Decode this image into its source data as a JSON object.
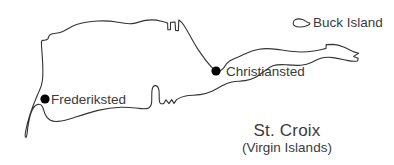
{
  "map": {
    "title": "St. Croix",
    "subtitle": "(Virgin Islands)",
    "background_color": "#ffffff",
    "outline_color": "#333333",
    "marker_color": "#000000",
    "text_color": "#3a3a3a",
    "cities": [
      {
        "name": "Frederiksted",
        "marker": "filled-circle",
        "x": 45,
        "y": 99
      },
      {
        "name": "Christiansted",
        "marker": "filled-circle",
        "x": 216,
        "y": 71
      }
    ],
    "islands": [
      {
        "name": "St. Croix",
        "labelled": false
      },
      {
        "name": "Buck Island",
        "labelled": true
      }
    ]
  }
}
